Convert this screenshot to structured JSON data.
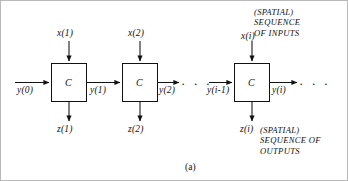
{
  "figure": {
    "label": "(a)",
    "block_letter": "C",
    "blocks": [
      {
        "id": "block-1",
        "letter": "C",
        "input_label": "x(1)",
        "output_label": "z(1)",
        "left_label": "y(0)",
        "right_label": "y(1)"
      },
      {
        "id": "block-2",
        "letter": "C",
        "input_label": "x(2)",
        "output_label": "z(2)",
        "left_label": "y(1)",
        "right_label": "y(2)"
      },
      {
        "id": "block-i",
        "letter": "C",
        "input_label": "x(i)",
        "output_label": "z(i)",
        "left_label": "y(i-1)",
        "right_label": "y(i)"
      }
    ],
    "ellipsis": "· · ·",
    "captions": {
      "inputs": "(SPATIAL)\nSEQUENCE\nOF INPUTS",
      "outputs": "(SPATIAL)\nSEQUENCE OF\nOUTPUTS"
    }
  },
  "colors": {
    "ink": "#111111",
    "frame": "#b9b9b9",
    "background": "#ffffff"
  }
}
